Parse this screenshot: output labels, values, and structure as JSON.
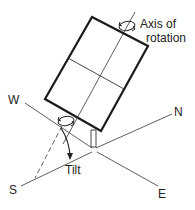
{
  "diagram": {
    "type": "tilted-single-axis-tracker",
    "labels": {
      "axis_line1": "Axis of",
      "axis_line2": "rotation",
      "tilt": "Tilt",
      "west": "W",
      "north": "N",
      "south": "S",
      "east": "E"
    },
    "colors": {
      "stroke": "#222222",
      "background": "#ffffff"
    }
  }
}
